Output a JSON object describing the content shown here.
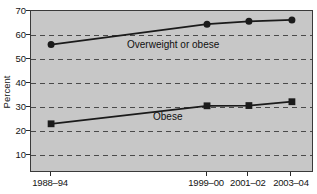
{
  "chart_data": {
    "type": "line",
    "title": "",
    "xlabel": "",
    "ylabel": "Percent",
    "ylim": [
      2.5,
      70
    ],
    "yticks": [
      70,
      60,
      50,
      40,
      30,
      20,
      10
    ],
    "grid": "dashed-horizontal",
    "legend": "inline-annotations",
    "categories": [
      "1988–94",
      "1999–00",
      "2001–02",
      "2003–04"
    ],
    "x_fractions": [
      0.071,
      0.622,
      0.77,
      0.922
    ],
    "series": [
      {
        "name": "Overweight or obese",
        "marker": "circle",
        "values": [
          56,
          64.5,
          65.7,
          66.3
        ]
      },
      {
        "name": "Obese",
        "marker": "square",
        "values": [
          23,
          30.5,
          30.6,
          32.2
        ]
      }
    ],
    "colors": {
      "plot_bg": "#c7c7c7",
      "page_bg": "#ffffff",
      "grid": "#4a4a4a",
      "line": "#1b1b1b",
      "marker": "#1b1b1b",
      "frame": "#3a3a3a",
      "text": "#141414"
    }
  }
}
